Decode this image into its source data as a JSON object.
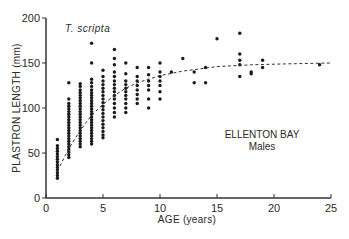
{
  "chart_data": {
    "type": "scatter",
    "title": "",
    "annotations": {
      "species": "T. scripta",
      "location": "ELLENTON BAY",
      "group": "Males"
    },
    "xlabel": "AGE (years)",
    "ylabel": "PLASTRON LENGTH (mm)",
    "xlim": [
      0,
      25
    ],
    "ylim": [
      0,
      200
    ],
    "xticks": [
      0,
      5,
      10,
      15,
      20,
      25
    ],
    "yticks": [
      0,
      50,
      100,
      150,
      200
    ],
    "grid": false,
    "legend": null,
    "series": [
      {
        "name": "Observed males",
        "marker": "filled-circle",
        "points": [
          [
            1,
            22
          ],
          [
            1,
            25
          ],
          [
            1,
            28
          ],
          [
            1,
            31
          ],
          [
            1,
            34
          ],
          [
            1,
            37
          ],
          [
            1,
            40
          ],
          [
            1,
            43
          ],
          [
            1,
            46
          ],
          [
            1,
            49
          ],
          [
            1,
            52
          ],
          [
            1,
            55
          ],
          [
            1,
            58
          ],
          [
            1,
            65
          ],
          [
            2,
            45
          ],
          [
            2,
            48
          ],
          [
            2,
            51
          ],
          [
            2,
            54
          ],
          [
            2,
            57
          ],
          [
            2,
            60
          ],
          [
            2,
            63
          ],
          [
            2,
            66
          ],
          [
            2,
            69
          ],
          [
            2,
            72
          ],
          [
            2,
            75
          ],
          [
            2,
            78
          ],
          [
            2,
            81
          ],
          [
            2,
            84
          ],
          [
            2,
            87
          ],
          [
            2,
            90
          ],
          [
            2,
            93
          ],
          [
            2,
            96
          ],
          [
            2,
            99
          ],
          [
            2,
            102
          ],
          [
            2,
            105
          ],
          [
            2,
            110
          ],
          [
            2,
            128
          ],
          [
            3,
            57
          ],
          [
            3,
            60
          ],
          [
            3,
            63
          ],
          [
            3,
            66
          ],
          [
            3,
            69
          ],
          [
            3,
            72
          ],
          [
            3,
            75
          ],
          [
            3,
            78
          ],
          [
            3,
            81
          ],
          [
            3,
            84
          ],
          [
            3,
            87
          ],
          [
            3,
            90
          ],
          [
            3,
            93
          ],
          [
            3,
            96
          ],
          [
            3,
            99
          ],
          [
            3,
            102
          ],
          [
            3,
            105
          ],
          [
            3,
            108
          ],
          [
            3,
            111
          ],
          [
            3,
            114
          ],
          [
            3,
            117
          ],
          [
            3,
            120
          ],
          [
            3,
            124
          ],
          [
            3,
            127
          ],
          [
            4,
            60
          ],
          [
            4,
            63
          ],
          [
            4,
            66
          ],
          [
            4,
            69
          ],
          [
            4,
            72
          ],
          [
            4,
            75
          ],
          [
            4,
            78
          ],
          [
            4,
            81
          ],
          [
            4,
            84
          ],
          [
            4,
            87
          ],
          [
            4,
            90
          ],
          [
            4,
            93
          ],
          [
            4,
            96
          ],
          [
            4,
            99
          ],
          [
            4,
            102
          ],
          [
            4,
            105
          ],
          [
            4,
            108
          ],
          [
            4,
            111
          ],
          [
            4,
            114
          ],
          [
            4,
            117
          ],
          [
            4,
            120
          ],
          [
            4,
            124
          ],
          [
            4,
            128
          ],
          [
            4,
            132
          ],
          [
            4,
            150
          ],
          [
            4,
            172
          ],
          [
            5,
            67
          ],
          [
            5,
            70
          ],
          [
            5,
            74
          ],
          [
            5,
            78
          ],
          [
            5,
            82
          ],
          [
            5,
            86
          ],
          [
            5,
            90
          ],
          [
            5,
            94
          ],
          [
            5,
            98
          ],
          [
            5,
            102
          ],
          [
            5,
            106
          ],
          [
            5,
            110
          ],
          [
            5,
            114
          ],
          [
            5,
            118
          ],
          [
            5,
            122
          ],
          [
            5,
            126
          ],
          [
            5,
            130
          ],
          [
            5,
            135
          ],
          [
            5,
            142
          ],
          [
            6,
            90
          ],
          [
            6,
            95
          ],
          [
            6,
            100
          ],
          [
            6,
            105
          ],
          [
            6,
            110
          ],
          [
            6,
            114
          ],
          [
            6,
            118
          ],
          [
            6,
            122
          ],
          [
            6,
            126
          ],
          [
            6,
            130
          ],
          [
            6,
            135
          ],
          [
            6,
            140
          ],
          [
            6,
            148
          ],
          [
            6,
            155
          ],
          [
            6,
            165
          ],
          [
            7,
            95
          ],
          [
            7,
            100
          ],
          [
            7,
            105
          ],
          [
            7,
            110
          ],
          [
            7,
            114
          ],
          [
            7,
            118
          ],
          [
            7,
            122
          ],
          [
            7,
            126
          ],
          [
            7,
            130
          ],
          [
            7,
            138
          ],
          [
            7,
            150
          ],
          [
            8,
            105
          ],
          [
            8,
            110
          ],
          [
            8,
            115
          ],
          [
            8,
            120
          ],
          [
            8,
            125
          ],
          [
            8,
            130
          ],
          [
            8,
            135
          ],
          [
            8,
            145
          ],
          [
            9,
            100
          ],
          [
            9,
            110
          ],
          [
            9,
            120
          ],
          [
            9,
            125
          ],
          [
            9,
            130
          ],
          [
            9,
            137
          ],
          [
            9,
            145
          ],
          [
            10,
            110
          ],
          [
            10,
            118
          ],
          [
            10,
            125
          ],
          [
            10,
            130
          ],
          [
            10,
            135
          ],
          [
            10,
            140
          ],
          [
            10,
            150
          ],
          [
            11,
            140
          ],
          [
            12,
            155
          ],
          [
            13,
            128
          ],
          [
            13,
            140
          ],
          [
            14,
            128
          ],
          [
            14,
            145
          ],
          [
            15,
            177
          ],
          [
            17,
            135
          ],
          [
            17,
            148
          ],
          [
            17,
            153
          ],
          [
            17,
            160
          ],
          [
            17,
            183
          ],
          [
            18,
            138
          ],
          [
            18,
            140
          ],
          [
            19,
            145
          ],
          [
            19,
            153
          ],
          [
            24,
            148
          ]
        ]
      },
      {
        "name": "Fitted growth curve",
        "style": "dashed",
        "x": [
          1,
          2,
          3,
          4,
          5,
          6,
          7,
          8,
          10,
          12,
          15,
          18,
          21,
          25
        ],
        "y": [
          30,
          55,
          75,
          92,
          104,
          114,
          122,
          128,
          136,
          141,
          146,
          148,
          149,
          150
        ]
      }
    ]
  }
}
